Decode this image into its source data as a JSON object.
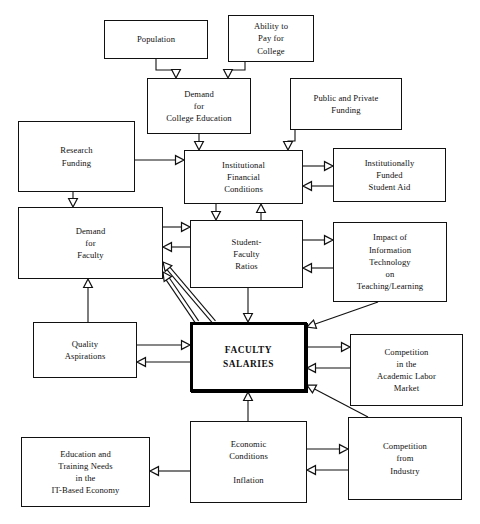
{
  "diagram": {
    "canvas": {
      "width": 480,
      "height": 524,
      "background": "#ffffff"
    },
    "style": {
      "box_border_color": "#111111",
      "emphasis_border_color": "#000000",
      "arrow_color": "#111111",
      "arrowhead": "hollow-triangle"
    },
    "nodes": [
      {
        "id": "population",
        "label": "Population",
        "x": 104,
        "y": 20,
        "w": 104,
        "h": 39,
        "emphasis": false
      },
      {
        "id": "ability_to_pay",
        "label": "Ability to\nPay for\nCollege",
        "x": 228,
        "y": 15,
        "w": 86,
        "h": 47,
        "emphasis": false
      },
      {
        "id": "demand_college",
        "label": "Demand\nfor\nCollege Education",
        "x": 147,
        "y": 78,
        "w": 104,
        "h": 56,
        "emphasis": false
      },
      {
        "id": "public_private",
        "label": "Public and Private\nFunding",
        "x": 290,
        "y": 78,
        "w": 112,
        "h": 52,
        "emphasis": false
      },
      {
        "id": "research_funding",
        "label": "Research\nFunding",
        "x": 18,
        "y": 121,
        "w": 117,
        "h": 71,
        "emphasis": false
      },
      {
        "id": "inst_financial",
        "label": "Institutional\nFinancial\nConditions",
        "x": 184,
        "y": 150,
        "w": 119,
        "h": 54,
        "emphasis": false
      },
      {
        "id": "student_aid",
        "label": "Institutionally\nFunded\nStudent Aid",
        "x": 333,
        "y": 148,
        "w": 113,
        "h": 54,
        "emphasis": false
      },
      {
        "id": "demand_faculty",
        "label": "Demand\nfor\nFaculty",
        "x": 18,
        "y": 207,
        "w": 145,
        "h": 72,
        "emphasis": false
      },
      {
        "id": "sf_ratios",
        "label": "Student-\nFaculty\nRatios",
        "x": 190,
        "y": 220,
        "w": 113,
        "h": 68,
        "emphasis": false
      },
      {
        "id": "it_impact",
        "label": "Impact of\nInformation\nTechnology\non\nTeaching/Learning",
        "x": 333,
        "y": 222,
        "w": 114,
        "h": 80,
        "emphasis": false
      },
      {
        "id": "quality_asp",
        "label": "Quality\nAspirations",
        "x": 33,
        "y": 322,
        "w": 104,
        "h": 56,
        "emphasis": false
      },
      {
        "id": "faculty_salaries",
        "label": "FACULTY\nSALARIES",
        "x": 190,
        "y": 322,
        "w": 117,
        "h": 70,
        "emphasis": true
      },
      {
        "id": "academic_labor",
        "label": "Competition\nin the\nAcademic Labor\nMarket",
        "x": 350,
        "y": 334,
        "w": 113,
        "h": 72,
        "emphasis": false
      },
      {
        "id": "it_economy",
        "label": "Education and\nTraining Needs\nin the\nIT-Based Economy",
        "x": 21,
        "y": 437,
        "w": 129,
        "h": 70,
        "emphasis": false
      },
      {
        "id": "economic_cond",
        "label": "Economic\nConditions\n\nInflation",
        "x": 190,
        "y": 421,
        "w": 117,
        "h": 82,
        "emphasis": false
      },
      {
        "id": "comp_industry",
        "label": "Competition\nfrom\nIndustry",
        "x": 348,
        "y": 417,
        "w": 114,
        "h": 83,
        "emphasis": false
      }
    ],
    "edges": [
      {
        "id": "e1",
        "from": "population",
        "to": "demand_college",
        "points": [
          [
            156,
            59
          ],
          [
            156,
            70
          ],
          [
            176,
            70
          ],
          [
            176,
            78
          ]
        ]
      },
      {
        "id": "e2",
        "from": "ability_to_pay",
        "to": "demand_college",
        "points": [
          [
            245,
            62
          ],
          [
            245,
            70
          ],
          [
            228,
            70
          ],
          [
            228,
            78
          ]
        ]
      },
      {
        "id": "e3",
        "from": "demand_college",
        "to": "inst_financial",
        "points": [
          [
            199,
            134
          ],
          [
            199,
            150
          ]
        ]
      },
      {
        "id": "e4",
        "from": "public_private",
        "to": "inst_financial",
        "points": [
          [
            295,
            130
          ],
          [
            295,
            141
          ],
          [
            288,
            141
          ],
          [
            288,
            150
          ]
        ]
      },
      {
        "id": "e5",
        "from": "research_funding",
        "to": "inst_financial",
        "points": [
          [
            135,
            160
          ],
          [
            184,
            160
          ]
        ]
      },
      {
        "id": "e6",
        "from": "research_funding",
        "to": "demand_faculty",
        "points": [
          [
            73,
            192
          ],
          [
            73,
            207
          ]
        ]
      },
      {
        "id": "e7",
        "from": "inst_financial",
        "to": "student_aid",
        "points": [
          [
            303,
            166
          ],
          [
            333,
            166
          ]
        ]
      },
      {
        "id": "e8",
        "from": "student_aid",
        "to": "inst_financial",
        "points": [
          [
            333,
            186
          ],
          [
            303,
            186
          ]
        ]
      },
      {
        "id": "e9",
        "from": "inst_financial",
        "to": "sf_ratios",
        "points": [
          [
            216,
            204
          ],
          [
            216,
            220
          ]
        ]
      },
      {
        "id": "e10",
        "from": "sf_ratios",
        "to": "inst_financial",
        "points": [
          [
            261,
            220
          ],
          [
            261,
            204
          ]
        ]
      },
      {
        "id": "e11",
        "from": "demand_faculty",
        "to": "sf_ratios",
        "points": [
          [
            163,
            227
          ],
          [
            190,
            227
          ]
        ]
      },
      {
        "id": "e12",
        "from": "sf_ratios",
        "to": "demand_faculty",
        "points": [
          [
            190,
            247
          ],
          [
            163,
            247
          ]
        ]
      },
      {
        "id": "e13",
        "from": "sf_ratios",
        "to": "it_impact",
        "points": [
          [
            303,
            240
          ],
          [
            333,
            240
          ]
        ]
      },
      {
        "id": "e14",
        "from": "it_impact",
        "to": "sf_ratios",
        "points": [
          [
            333,
            268
          ],
          [
            303,
            268
          ]
        ]
      },
      {
        "id": "e15",
        "from": "quality_asp",
        "to": "demand_faculty",
        "points": [
          [
            88,
            322
          ],
          [
            88,
            279
          ]
        ]
      },
      {
        "id": "e16",
        "from": "sf_ratios",
        "to": "faculty_salaries",
        "points": [
          [
            248,
            288
          ],
          [
            248,
            322
          ]
        ]
      },
      {
        "id": "e17",
        "from": "quality_asp",
        "to": "faculty_salaries",
        "points": [
          [
            137,
            345
          ],
          [
            190,
            345
          ]
        ]
      },
      {
        "id": "e18",
        "from": "faculty_salaries",
        "to": "quality_asp",
        "points": [
          [
            190,
            362
          ],
          [
            137,
            362
          ]
        ]
      },
      {
        "id": "e19",
        "from": "faculty_salaries",
        "to": "academic_labor",
        "points": [
          [
            307,
            347
          ],
          [
            350,
            347
          ]
        ]
      },
      {
        "id": "e20",
        "from": "academic_labor",
        "to": "faculty_salaries",
        "points": [
          [
            350,
            368
          ],
          [
            307,
            368
          ]
        ]
      },
      {
        "id": "e21",
        "from": "it_impact",
        "to": "faculty_salaries",
        "points": [
          [
            378,
            302
          ],
          [
            307,
            327
          ]
        ]
      },
      {
        "id": "e22",
        "from": "comp_industry",
        "to": "faculty_salaries",
        "points": [
          [
            368,
            417
          ],
          [
            307,
            385
          ]
        ]
      },
      {
        "id": "e23",
        "from": "economic_cond",
        "to": "faculty_salaries",
        "points": [
          [
            248,
            421
          ],
          [
            248,
            392
          ]
        ]
      },
      {
        "id": "e24",
        "from": "economic_cond",
        "to": "it_economy",
        "points": [
          [
            190,
            471
          ],
          [
            150,
            471
          ]
        ]
      },
      {
        "id": "e25",
        "from": "economic_cond",
        "to": "comp_industry",
        "points": [
          [
            307,
            449
          ],
          [
            348,
            449
          ]
        ]
      },
      {
        "id": "e26",
        "from": "comp_industry",
        "to": "economic_cond",
        "points": [
          [
            348,
            470
          ],
          [
            307,
            470
          ]
        ]
      },
      {
        "id": "e27",
        "from": "faculty_salaries",
        "to": "demand_faculty",
        "points": [
          [
            197,
            322
          ],
          [
            163,
            272
          ]
        ],
        "double": true
      },
      {
        "id": "e28",
        "from": "faculty_salaries",
        "to": "demand_faculty",
        "points": [
          [
            214,
            322
          ],
          [
            163,
            262
          ]
        ],
        "double": true
      }
    ]
  }
}
